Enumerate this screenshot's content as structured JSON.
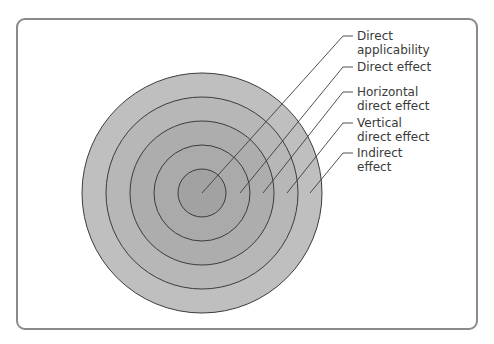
{
  "diagram": {
    "type": "concentric-circles",
    "center": [
      202,
      193
    ],
    "rings": [
      {
        "radius": 120,
        "fill": "#bfbfbf"
      },
      {
        "radius": 96,
        "fill": "#b7b7b7"
      },
      {
        "radius": 72,
        "fill": "#adadad"
      },
      {
        "radius": 48,
        "fill": "#aaaaaa"
      },
      {
        "radius": 24,
        "fill": "#a2a2a2"
      }
    ],
    "stroke": "#3c3c3c",
    "labels": [
      {
        "line1": "Direct",
        "line2": "applicability",
        "tick_y": 36,
        "target": [
          202,
          193
        ]
      },
      {
        "line1": "Direct effect",
        "line2": "",
        "tick_y": 67,
        "target": [
          240,
          193
        ]
      },
      {
        "line1": "Horizontal",
        "line2": "direct effect",
        "tick_y": 92,
        "target": [
          263,
          193
        ]
      },
      {
        "line1": "Vertical",
        "line2": "direct effect",
        "tick_y": 123,
        "target": [
          287,
          193
        ]
      },
      {
        "line1": "Indirect",
        "line2": "effect",
        "tick_y": 153,
        "target": [
          310,
          193
        ]
      }
    ]
  }
}
